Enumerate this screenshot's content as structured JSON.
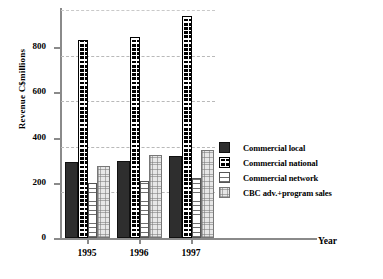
{
  "chart_data": {
    "type": "bar",
    "title": "",
    "xlabel": "Year",
    "ylabel": "Revenue C$millions",
    "categories": [
      "1995",
      "1996",
      "1997"
    ],
    "ylim": [
      0,
      1000
    ],
    "yticks": [
      0,
      200,
      400,
      600,
      800
    ],
    "ytick_labels": [
      "0",
      "200",
      "400",
      "600",
      "800"
    ],
    "grid": true,
    "gridlines": [
      0,
      200,
      400,
      600,
      800,
      1000
    ],
    "legend_position": "right",
    "series": [
      {
        "name": "Commercial local",
        "pattern": "dark-solid",
        "values": [
          335,
          340,
          360
        ]
      },
      {
        "name": "Commercial national",
        "pattern": "black-checker",
        "values": [
          868,
          880,
          975
        ]
      },
      {
        "name": "Commercial network",
        "pattern": "white-horizontal-lines",
        "values": [
          240,
          250,
          265
        ]
      },
      {
        "name": "CBC adv.+program sales",
        "pattern": "light-dotted",
        "values": [
          318,
          365,
          385
        ]
      }
    ]
  },
  "axes": {
    "y_title": "Revenue C$millions",
    "x_title": "Year",
    "y_ticks": [
      "800",
      "600",
      "400",
      "200",
      "0"
    ],
    "x_categories": [
      "1995",
      "1996",
      "1997"
    ]
  },
  "legend": {
    "items": [
      {
        "label": "Commercial local"
      },
      {
        "label": "Commercial national"
      },
      {
        "label": "Commercial network"
      },
      {
        "label": "CBC adv.+program sales"
      }
    ]
  },
  "colors": {
    "axis": "#8a8a8a",
    "grid": "#b9b9b9",
    "local": "#2e2e2e",
    "national": "#000000",
    "network": "#ffffff",
    "cbc": "#e7e7e7",
    "text": "#000000"
  }
}
